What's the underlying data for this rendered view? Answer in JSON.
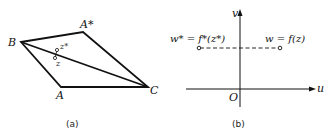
{
  "panel_a": {
    "caption": "(a)",
    "vertices": {
      "B": {
        "label": "B",
        "x": 21,
        "y": 42
      },
      "A_star": {
        "label": "A*",
        "x": 83,
        "y": 32
      },
      "C": {
        "label": "C",
        "x": 148,
        "y": 87
      },
      "A": {
        "label": "A",
        "x": 61,
        "y": 87
      }
    },
    "points": {
      "z_star": {
        "label": "z*",
        "x": 57,
        "y": 50
      },
      "z": {
        "label": "z",
        "x": 55,
        "y": 58
      }
    }
  },
  "panel_b": {
    "caption": "(b)",
    "axes": {
      "u_label": "u",
      "v_label": "v",
      "origin_label": "O"
    },
    "left_point_label": "w* = f*(z*)",
    "right_point_label": "w = f(z)"
  },
  "colors": {
    "line": "#111111",
    "background": "#ffffff"
  }
}
